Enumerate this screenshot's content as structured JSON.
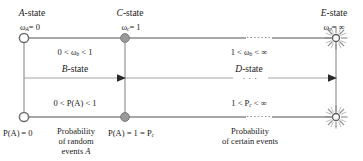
{
  "figure": {
    "type": "state-transition-diagram",
    "background": "#ffffff",
    "line_color": "#808080",
    "text_color": "#1a1a1a",
    "node_fill_open": "#ffffff",
    "node_fill_solid": "#9a9a9a"
  },
  "states": {
    "a": {
      "title_italic": "A",
      "title_rest": "-state",
      "omega": "ω",
      "omega_sub": "A",
      "omega_value": "= 0",
      "prob": "P(A) = 0",
      "node": "open-circle"
    },
    "c": {
      "title_italic": "C",
      "title_rest": "-state",
      "omega": "ω",
      "omega_sub": "c",
      "omega_value": "= 1",
      "prob": "P(A) = 1 = P",
      "prob_sub": "c",
      "node": "solid-circle"
    },
    "e": {
      "title_italic": "E",
      "title_rest": "-state",
      "omega": "ω",
      "omega_sub": "e",
      "omega_value": "= ∞",
      "node": "starburst"
    },
    "b": {
      "title_italic": "B",
      "title_rest": "-state",
      "omega_range_pre": "0 < ",
      "omega": "ω",
      "omega_sub": "b",
      "omega_range_post": " < 1",
      "prob_range": "0 < P(A) < 1"
    },
    "d": {
      "title_italic": "D",
      "title_rest": "-state",
      "omega_range_pre": "1 < ",
      "omega": "ω",
      "omega_sub": "b",
      "omega_range_post": " < ∞",
      "prob_range_pre": "1 < P",
      "prob_sub": "c",
      "prob_range_post": " < ∞"
    }
  },
  "captions": {
    "left_line1": "Probability",
    "left_line2": "of random",
    "left_line3_italicless": "events ",
    "left_line3_italic": "A",
    "right_line1": "Probability",
    "right_line2": "of certain events"
  },
  "ellipses": {
    "middle_dots": "·  ·  ·"
  }
}
